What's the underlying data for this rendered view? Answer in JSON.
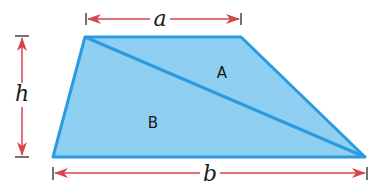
{
  "diagram": {
    "shape": "trapezoid",
    "colors": {
      "fill": "#8fd0f2",
      "stroke": "#2b9be0",
      "arrow": "#d8444e",
      "tick": "#444444",
      "text": "#1a1a1a"
    },
    "vertices": {
      "top_left": [
        85,
        37
      ],
      "top_right": [
        241,
        37
      ],
      "bottom_right": [
        365,
        157
      ],
      "bottom_left": [
        53,
        157
      ]
    },
    "diagonal": {
      "from": "top_left",
      "to": "bottom_right"
    },
    "regions": [
      {
        "label": "A",
        "x": 222,
        "y": 78
      },
      {
        "label": "B",
        "x": 153,
        "y": 128
      }
    ],
    "dimensions": {
      "top": {
        "label": "a",
        "meaning": "top base"
      },
      "bottom": {
        "label": "b",
        "meaning": "bottom base"
      },
      "height": {
        "label": "h",
        "meaning": "height"
      }
    }
  }
}
